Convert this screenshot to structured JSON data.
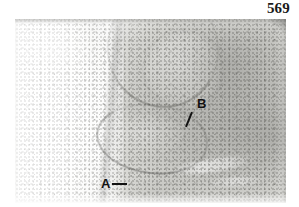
{
  "page": {
    "number": "569",
    "background_color": "#ffffff",
    "width": 299,
    "height": 207
  },
  "figure": {
    "kind": "photomicrograph",
    "tone": {
      "paper": "#ffffff",
      "film_light": "#f4f4f2",
      "film_mid": "#d8d8d4",
      "film_dark": "#7a7a76",
      "nuclei": "#3a3a36"
    },
    "annotations": [
      {
        "label": "A",
        "name": "label-a",
        "leader": "horizontal-dash-right",
        "color": "#111111"
      },
      {
        "label": "B",
        "name": "label-b",
        "leader": "diagonal-down-left",
        "color": "#111111"
      }
    ]
  }
}
